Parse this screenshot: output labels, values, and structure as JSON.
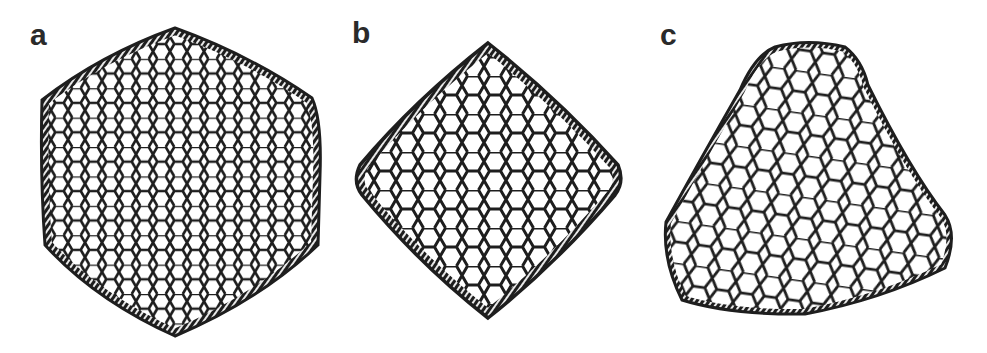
{
  "figure": {
    "panels": [
      {
        "label": "a",
        "shape": "icosahedral-cage"
      },
      {
        "label": "b",
        "shape": "octahedral-cage"
      },
      {
        "label": "c",
        "shape": "tetrahedral-cage"
      }
    ],
    "colors": {
      "background": "#ffffff",
      "lattice": "#1e1e1e",
      "label": "#2a2a2a"
    }
  }
}
